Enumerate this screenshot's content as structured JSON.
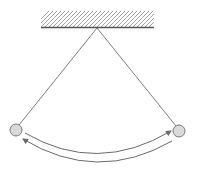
{
  "diagram": {
    "type": "pendulum",
    "colors": {
      "background": "#ffffff",
      "line": "#6e6e6e",
      "hatch": "#9a9a9a",
      "ceiling": "#555555",
      "bob_fill": "#d9d9d9",
      "bob_stroke": "#7a7a7a",
      "arrow": "#6a6a6a"
    },
    "ceiling": {
      "x1": 41,
      "x2": 154,
      "y": 27,
      "hatch_top": 11
    },
    "pivot": {
      "x": 97,
      "y": 28
    },
    "bobs": [
      {
        "name": "left",
        "cx": 16,
        "cy": 130,
        "r": 6
      },
      {
        "name": "right",
        "cx": 179,
        "cy": 131,
        "r": 6
      }
    ],
    "arrows": [
      {
        "name": "swing-right",
        "direction": "left-to-right"
      },
      {
        "name": "swing-left",
        "direction": "right-to-left"
      }
    ]
  }
}
